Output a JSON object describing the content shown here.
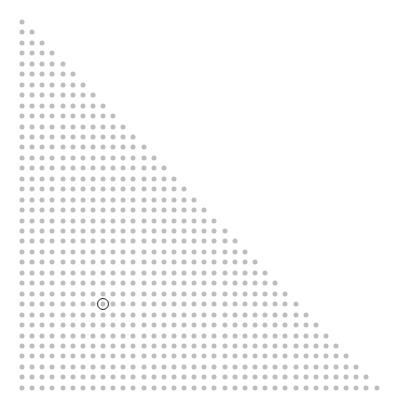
{
  "board": {
    "shape": "right-triangle-dot-grid",
    "rows": 36,
    "row_pattern": "row r contains r+1 dots (r = 0..35)",
    "origin": {
      "x": 22,
      "y": 22
    },
    "spacing": {
      "x": 10.13,
      "y": 10.45
    },
    "dot_diameter": 5,
    "dot_color": "#bdbdbd",
    "background": "#ffffff"
  },
  "selection": {
    "row": 27,
    "col": 8,
    "ring_color": "#222222",
    "ring_diameter": 10
  }
}
